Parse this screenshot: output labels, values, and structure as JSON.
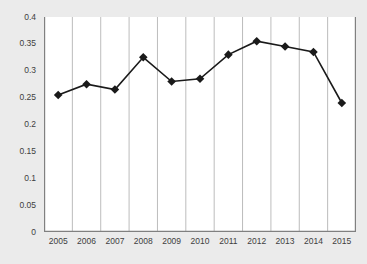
{
  "chart_data": {
    "type": "line",
    "title": "",
    "subtitle": "",
    "xlabel": "",
    "ylabel": "",
    "categories": [
      "2005",
      "2006",
      "2007",
      "2008",
      "2009",
      "2010",
      "2011",
      "2012",
      "2013",
      "2014",
      "2015"
    ],
    "values": [
      0.255,
      0.275,
      0.265,
      0.325,
      0.28,
      0.285,
      0.33,
      0.355,
      0.345,
      0.335,
      0.24
    ],
    "series": [
      {
        "name": "",
        "values": [
          0.255,
          0.275,
          0.265,
          0.325,
          0.28,
          0.285,
          0.33,
          0.355,
          0.345,
          0.335,
          0.24
        ]
      }
    ],
    "ylim": [
      0,
      0.4
    ],
    "ytick_labels": [
      "0",
      "0.05",
      "0.1",
      "0.15",
      "0.2",
      "0.25",
      "0.3",
      "0.35",
      "0.4"
    ],
    "ytick_values": [
      0,
      0.05,
      0.1,
      0.15,
      0.2,
      0.25,
      0.3,
      0.35,
      0.4
    ],
    "xtick_labels": [
      "2005",
      "2006",
      "2007",
      "2008",
      "2009",
      "2010",
      "2011",
      "2012",
      "2013",
      "2014",
      "2015"
    ],
    "grid": {
      "vertical": true,
      "horizontal": false,
      "vertical_color": "#b4b4b4"
    },
    "legend": {
      "visible": false,
      "position": "none",
      "entries": []
    },
    "marker": {
      "shape": "diamond",
      "color": "#1a1a1a",
      "size": 7
    },
    "line": {
      "color": "#1a1a1a",
      "width": 1.6
    },
    "colors": {
      "series": "#1a1a1a",
      "plot_background": "#ffffff",
      "figure_background": "#ebebeb",
      "axis": "#808080",
      "tick_text": "#404040"
    },
    "annotations": []
  },
  "footer": {
    "source_note": ""
  }
}
